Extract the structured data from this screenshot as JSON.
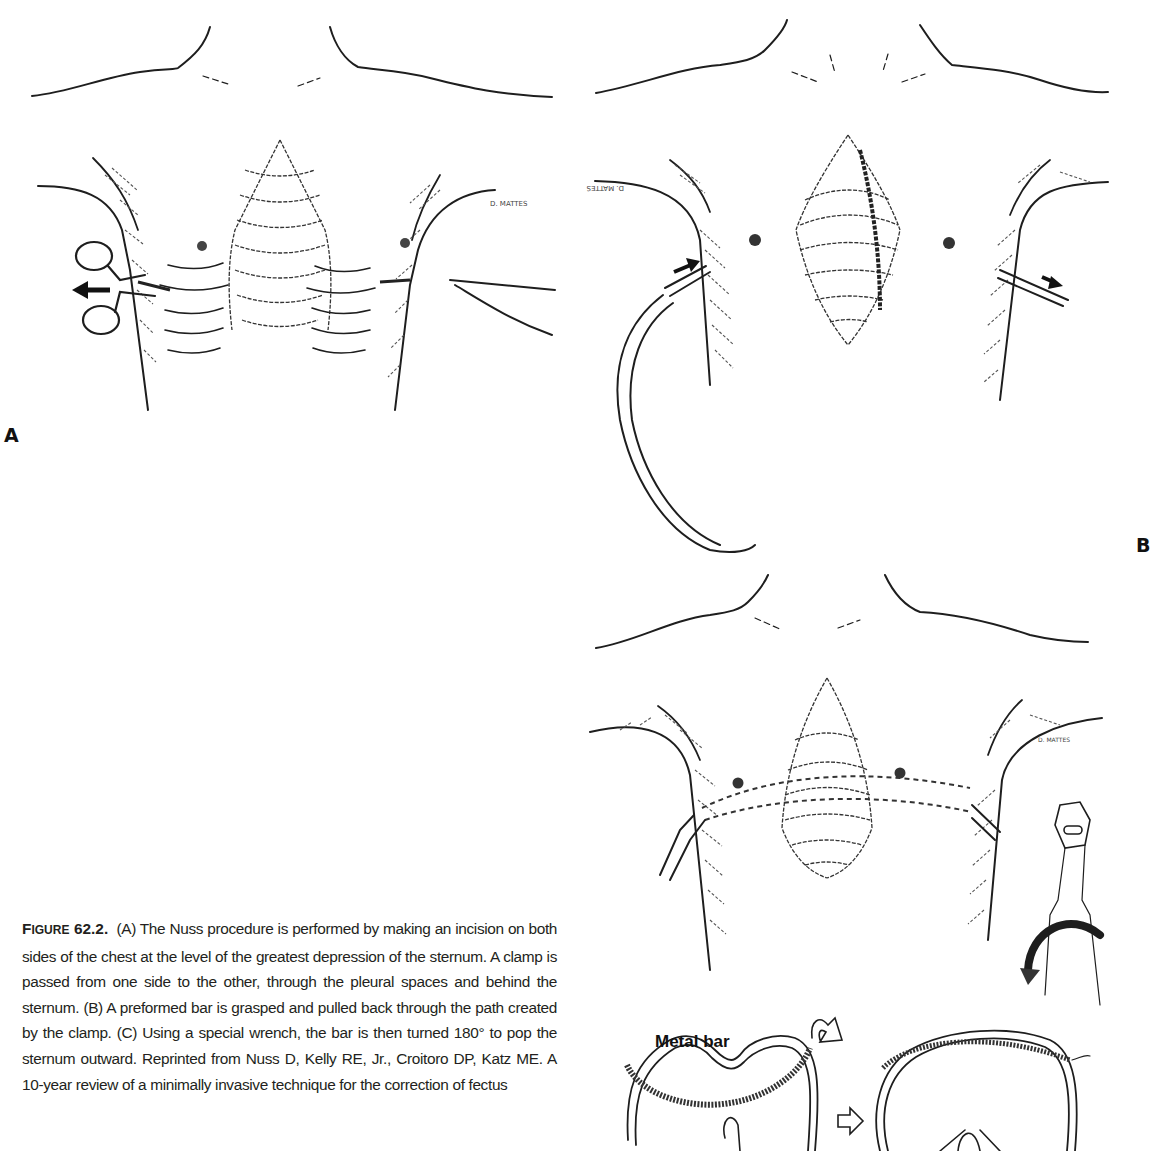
{
  "figure": {
    "number": "62.2",
    "panels": [
      {
        "id": "A",
        "label": "A",
        "description": "Clamp passed from one side of chest to the other behind the sternum; arrow indicates clamp withdrawn to the left"
      },
      {
        "id": "B",
        "label": "B",
        "description": "Preformed bar grasped and pulled back through the path created by the clamp; arrows indicate direction"
      },
      {
        "id": "C",
        "label": "",
        "description": "Bar turned 180 degrees with special wrench; cross-section shows metal bar before and after rotation"
      }
    ],
    "annotations": {
      "metal_bar": "Metal bar",
      "artist_signature_a": "D. MATTES",
      "artist_signature_b": "D. MATTES",
      "artist_signature_c": "D. MATTES"
    },
    "caption": {
      "head_first_letter": "F",
      "head_rest": "IGURE",
      "head_number": "62.2.",
      "text": "(A) The Nuss procedure is performed by making an incision on both sides of the chest at the level of the greatest depression of the sternum. A clamp is passed from one side to the other, through the pleural spaces and behind the sternum. (B) A preformed bar is grasped and pulled back through the path created by the clamp. (C) Using a special wrench, the bar is then turned 180° to pop the sternum outward. Reprinted from Nuss D, Kelly RE, Jr., Croitoro DP, Katz ME. A 10-year review of a minimally invasive technique for the correction of fectus"
    }
  }
}
